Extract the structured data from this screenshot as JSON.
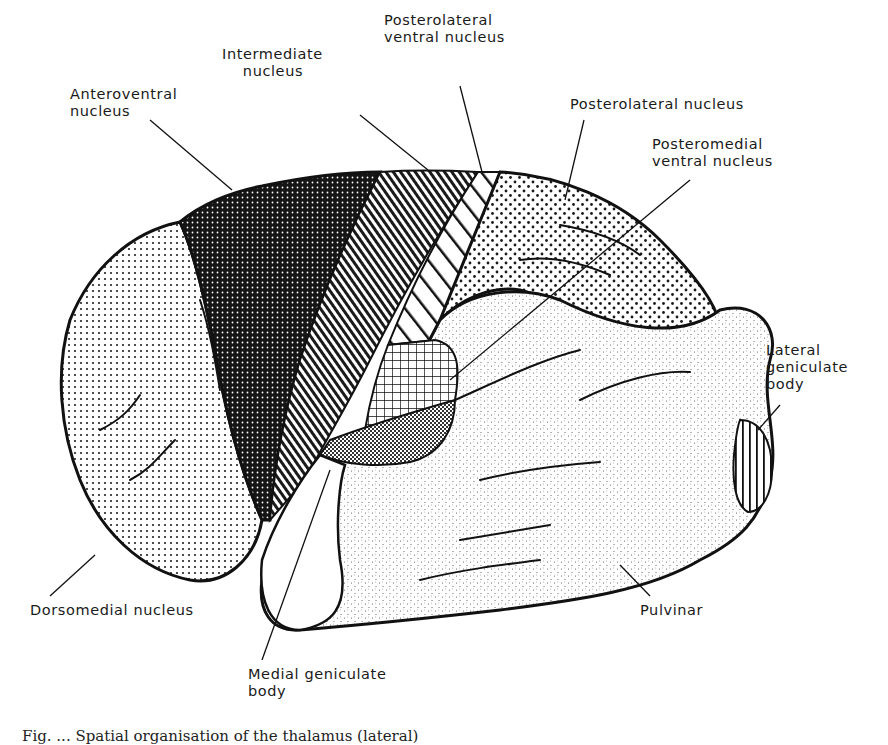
{
  "figure": {
    "type": "anatomical diagram",
    "labels": [
      {
        "id": "anteroventral",
        "text": "Anteroventral\nnucleus",
        "x": 70,
        "y": 86
      },
      {
        "id": "intermediate",
        "text": "Intermediate\n    nucleus",
        "x": 222,
        "y": 46
      },
      {
        "id": "posterolateral-ventral",
        "text": "Posterolateral\nventral nucleus",
        "x": 384,
        "y": 12
      },
      {
        "id": "posterolateral",
        "text": "Posterolateral nucleus",
        "x": 570,
        "y": 96
      },
      {
        "id": "posteromedial-ventral",
        "text": "Posteromedial\nventral nucleus",
        "x": 652,
        "y": 136
      },
      {
        "id": "lateral-geniculate",
        "text": "Lateral\ngeniculate\nbody",
        "x": 766,
        "y": 342
      },
      {
        "id": "dorsomedial",
        "text": "Dorsomedial nucleus",
        "x": 30,
        "y": 602
      },
      {
        "id": "pulvinar",
        "text": "Pulvinar",
        "x": 640,
        "y": 602
      },
      {
        "id": "medial-geniculate",
        "text": "Medial geniculate\nbody",
        "x": 248,
        "y": 666
      }
    ],
    "caption": "Fig. ... Spatial organisation of the thalamus (lateral)"
  },
  "colors": {
    "ink": "#111111",
    "paper": "#ffffff",
    "anteroventral_fill": "#1c1c1c",
    "stipple_light": "#b8b8b8"
  }
}
